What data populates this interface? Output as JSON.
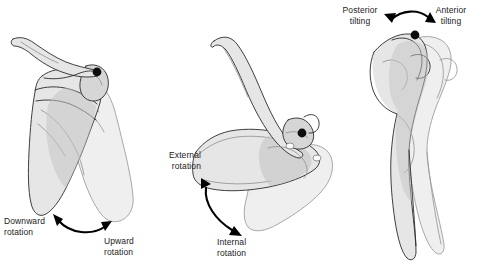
{
  "figure": {
    "background_color": "#ffffff",
    "label_color": "#1b1b1b",
    "bone_outline_color": "#2a2a2a",
    "bone_fill_light": "#e6e6e6",
    "bone_fill_mid": "#d6d6d6",
    "bone_fill_dark": "#c4c4c4",
    "arrow_color": "#000000",
    "pivot_color": "#0d0d0d"
  },
  "panels": [
    {
      "id": "panel-rotation",
      "view": "posterior view of scapula and clavicle",
      "arrow": "double-headed curved arrow",
      "labels": [
        {
          "id": "downward-rotation",
          "line1": "Downward",
          "line2": "rotation"
        },
        {
          "id": "upward-rotation",
          "line1": "Upward",
          "line2": "rotation"
        }
      ]
    },
    {
      "id": "panel-internal-external-rotation",
      "view": "superior view of scapula and clavicle",
      "arrow": "double-headed curved arrow",
      "labels": [
        {
          "id": "external-rotation",
          "line1": "External",
          "line2": "rotation"
        },
        {
          "id": "internal-rotation",
          "line1": "Internal",
          "line2": "rotation"
        }
      ]
    },
    {
      "id": "panel-tilting",
      "view": "lateral view of scapula",
      "arrow": "double-headed curved arrow",
      "labels": [
        {
          "id": "posterior-tilting",
          "line1": "Posterior",
          "line2": "tilting"
        },
        {
          "id": "anterior-tilting",
          "line1": "Anterior",
          "line2": "tilting"
        }
      ]
    }
  ],
  "labels": {
    "downward_rotation_1": "Downward",
    "downward_rotation_2": "rotation",
    "upward_rotation_1": "Upward",
    "upward_rotation_2": "rotation",
    "external_rotation_1": "External",
    "external_rotation_2": "rotation",
    "internal_rotation_1": "Internal",
    "internal_rotation_2": "rotation",
    "posterior_tilting_1": "Posterior",
    "posterior_tilting_2": "tilting",
    "anterior_tilting_1": "Anterior",
    "anterior_tilting_2": "tilting"
  }
}
